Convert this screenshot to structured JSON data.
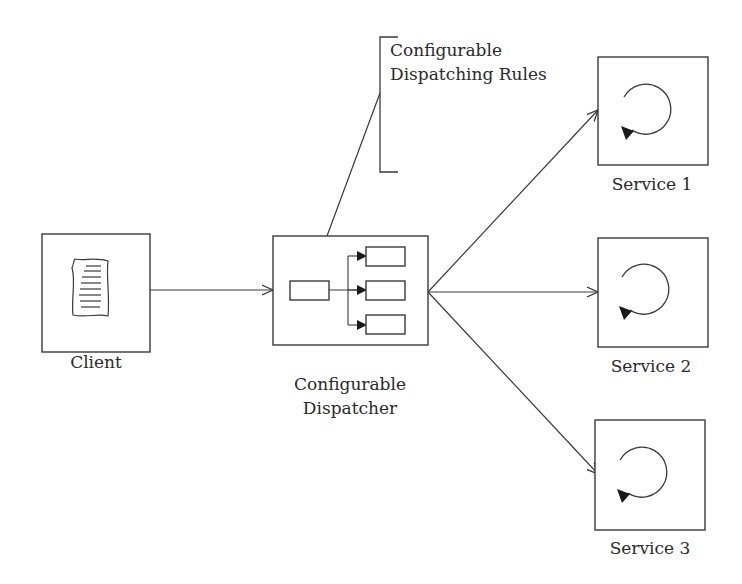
{
  "diagram": {
    "client": {
      "label": "Client",
      "icon": "document-icon"
    },
    "dispatcher": {
      "label_line1": "Configurable",
      "label_line2": "Dispatcher",
      "icon": "dispatch-routing-icon"
    },
    "rules": {
      "label_line1": "Configurable",
      "label_line2": "Dispatching Rules"
    },
    "services": [
      {
        "label": "Service 1",
        "icon": "cycle-icon"
      },
      {
        "label": "Service 2",
        "icon": "cycle-icon"
      },
      {
        "label": "Service 3",
        "icon": "cycle-icon"
      }
    ],
    "connections": [
      {
        "from": "Client",
        "to": "Configurable Dispatcher"
      },
      {
        "from": "Configurable Dispatcher",
        "to": "Configurable Dispatching Rules"
      },
      {
        "from": "Configurable Dispatcher",
        "to": "Service 1"
      },
      {
        "from": "Configurable Dispatcher",
        "to": "Service 2"
      },
      {
        "from": "Configurable Dispatcher",
        "to": "Service 3"
      }
    ],
    "colors": {
      "line": "#3a3a3a",
      "text": "#2a2a2a",
      "background": "#ffffff"
    }
  }
}
